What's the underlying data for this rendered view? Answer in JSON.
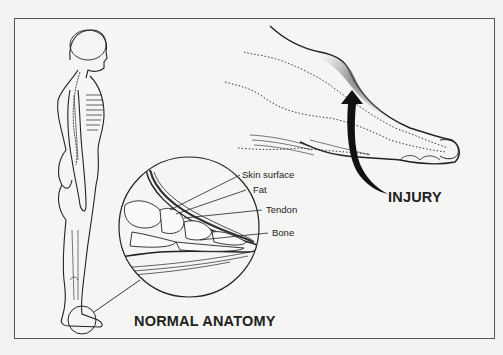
{
  "figure": {
    "type": "medical-illustration",
    "panels": {
      "normal": {
        "title": "NORMAL ANATOMY",
        "callouts": [
          "Skin surface",
          "Fat",
          "Tendon",
          "Bone"
        ]
      },
      "injury": {
        "title": "INJURY"
      }
    }
  },
  "colors": {
    "line": "#222222",
    "frame": "#555555",
    "background": "#f2f2f0"
  }
}
